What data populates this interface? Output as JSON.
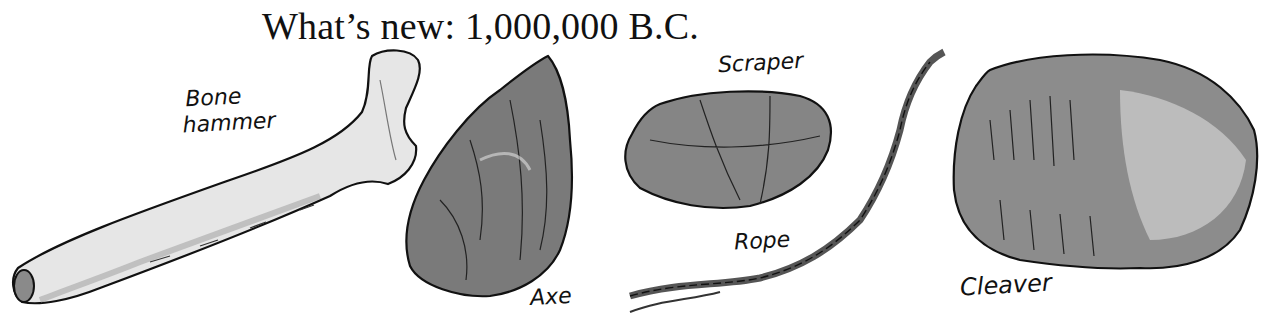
{
  "title": {
    "prefix": "What’s new: 1,000,000",
    "era": "B.C."
  },
  "items": [
    {
      "id": "bone-hammer",
      "label_line1": "Bone",
      "label_line2": "hammer"
    },
    {
      "id": "axe",
      "label": "Axe"
    },
    {
      "id": "scraper",
      "label": "Scraper"
    },
    {
      "id": "rope",
      "label": "Rope"
    },
    {
      "id": "cleaver",
      "label": "Cleaver"
    }
  ],
  "colors": {
    "ink": "#111111",
    "bone_fill": "#e6e6e6",
    "stone_dark": "#6e6e6e",
    "stone_mid": "#8a8a8a",
    "stone_light": "#b8b8b8"
  }
}
